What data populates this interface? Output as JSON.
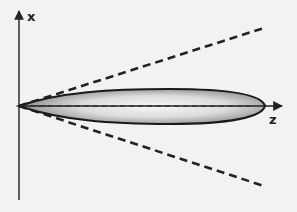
{
  "diagram": {
    "axes": {
      "x_label": "x",
      "z_label": "z"
    },
    "elements": {
      "beam_shape": "elongated ellipsoid along z-axis, gray radial shading",
      "cone_lines": "two dashed lines diverging from origin",
      "center_line": "dashed line along z-axis inside ellipsoid"
    },
    "colors": {
      "background": "#f2f2f0",
      "lines": "#222222",
      "fill_center": "#f4f4f4",
      "fill_edge": "#9a9a9a"
    }
  }
}
